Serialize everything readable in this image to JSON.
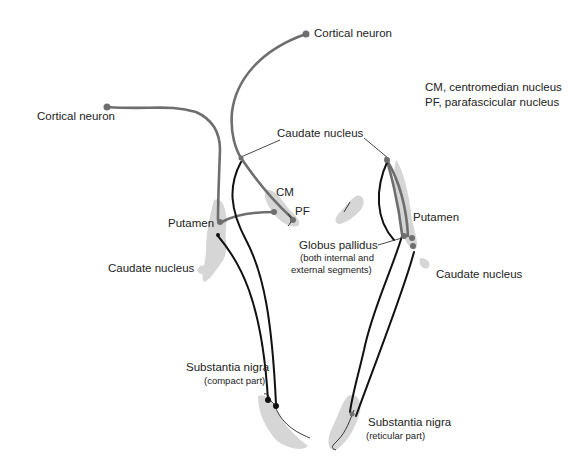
{
  "labels": {
    "cortical_neuron_top": "Cortical neuron",
    "cortical_neuron_left": "Cortical neuron",
    "caudate_nucleus_top": "Caudate nucleus",
    "cm": "CM",
    "pf": "PF",
    "putamen_left": "Putamen",
    "caudate_nucleus_left": "Caudate nucleus",
    "putamen_right": "Putamen",
    "globus_pallidus": "Globus pallidus",
    "globus_pallidus_sub1": "(both internal and",
    "globus_pallidus_sub2": "external segments)",
    "caudate_nucleus_right": "Caudate nucleus",
    "substantia_nigra_compact": "Substantia nigra",
    "substantia_nigra_compact_sub": "(compact part)",
    "substantia_nigra_reticular": "Substantia nigra",
    "substantia_nigra_reticular_sub": "(reticular part)"
  },
  "legend": {
    "line1": "CM, centromedian nucleus",
    "line2": "PF, parafascicular nucleus"
  },
  "colors": {
    "grey_pathway": "#6e6e6e",
    "black_pathway": "#111111",
    "region_fill": "#d4d4d4"
  }
}
